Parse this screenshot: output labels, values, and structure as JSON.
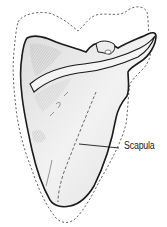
{
  "figure": {
    "colors": {
      "background": "#ffffff",
      "bone_fill": "#ececec",
      "bone_shade": "#cfcfcf",
      "bone_outline": "#1a1a1a",
      "dashed_outline": "#666666",
      "label_text": "#222222"
    }
  },
  "labels": {
    "scapula": "Scapula"
  }
}
